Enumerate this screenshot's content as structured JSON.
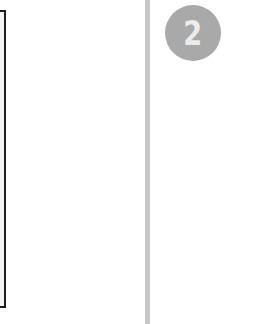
{
  "step": {
    "number": "2",
    "badge_color": "#a9a9a9",
    "number_color": "#ececec"
  },
  "divider": {
    "color": "#c8c8c8"
  },
  "left_panel": {
    "border_color": "#1e1e1e",
    "fill_color": "#f4f4f4"
  }
}
